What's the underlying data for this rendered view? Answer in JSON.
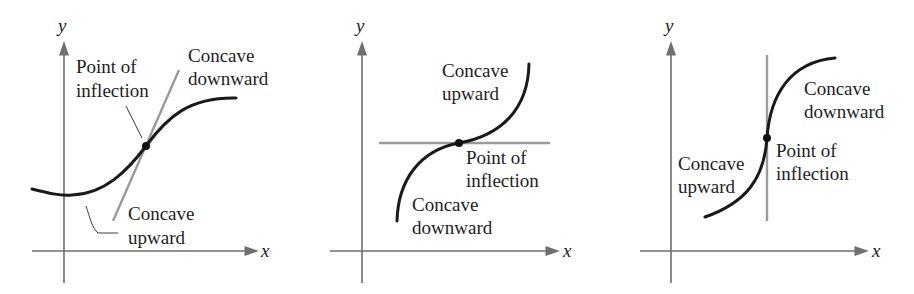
{
  "figure": {
    "panels": [
      {
        "id": "tangent-oblique",
        "x_label": "x",
        "y_label": "y",
        "labels": {
          "inflection_line1": "Point of",
          "inflection_line2": "inflection",
          "down_line1": "Concave",
          "down_line2": "downward",
          "up_line1": "Concave",
          "up_line2": "upward"
        }
      },
      {
        "id": "tangent-horizontal",
        "x_label": "x",
        "y_label": "y",
        "labels": {
          "up_line1": "Concave",
          "up_line2": "upward",
          "inflection_line1": "Point of",
          "inflection_line2": "inflection",
          "down_line1": "Concave",
          "down_line2": "downward"
        }
      },
      {
        "id": "tangent-vertical",
        "x_label": "x",
        "y_label": "y",
        "labels": {
          "down_line1": "Concave",
          "down_line2": "downward",
          "inflection_line1": "Point of",
          "inflection_line2": "inflection",
          "up_line1": "Concave",
          "up_line2": "upward"
        }
      }
    ],
    "colors": {
      "curve": "#1a1a1a",
      "tangent": "#9a9a9a",
      "axis": "#6f6f6f"
    }
  }
}
